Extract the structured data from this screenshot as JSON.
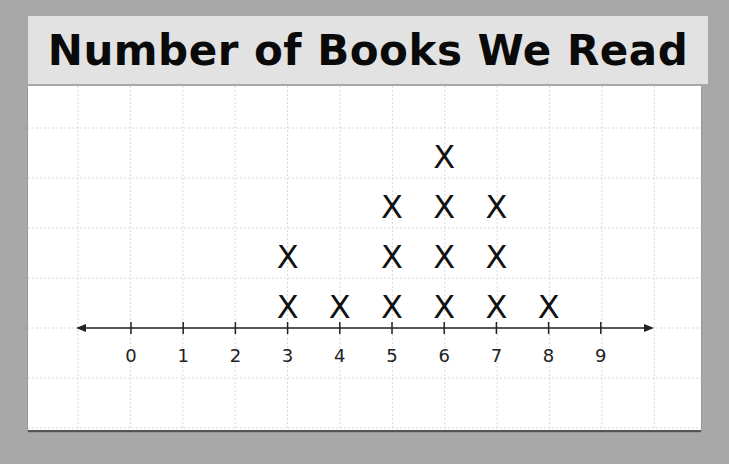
{
  "title": "Number of Books We Read",
  "chart_data": {
    "type": "line-plot",
    "title": "Number of Books We Read",
    "xlabel": "",
    "ylabel": "",
    "categories": [
      "0",
      "1",
      "2",
      "3",
      "4",
      "5",
      "6",
      "7",
      "8",
      "9"
    ],
    "values": [
      0,
      0,
      0,
      2,
      1,
      3,
      4,
      3,
      1,
      0
    ],
    "marker": "X",
    "xlim": [
      0,
      9
    ],
    "grid": true
  }
}
